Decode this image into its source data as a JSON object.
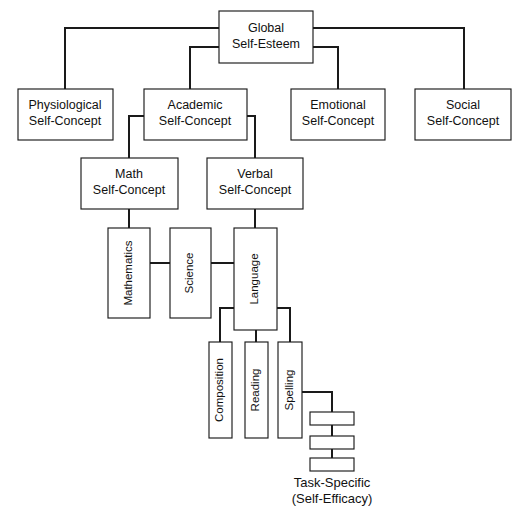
{
  "diagram": {
    "orientation": "top-down hierarchy",
    "colors": {
      "background": "#ffffff",
      "box_fill": "#ffffff",
      "stroke": "#1a1a1a",
      "text": "#111111"
    },
    "levels": {
      "level1": {
        "nodes": [
          {
            "id": "global",
            "line1": "Global",
            "line2": "Self-Esteem"
          }
        ]
      },
      "level2": {
        "nodes": [
          {
            "id": "physiological",
            "line1": "Physiological",
            "line2": "Self-Concept"
          },
          {
            "id": "academic",
            "line1": "Academic",
            "line2": "Self-Concept"
          },
          {
            "id": "emotional",
            "line1": "Emotional",
            "line2": "Self-Concept"
          },
          {
            "id": "social",
            "line1": "Social",
            "line2": "Self-Concept"
          }
        ]
      },
      "level3": {
        "nodes": [
          {
            "id": "math",
            "line1": "Math",
            "line2": "Self-Concept"
          },
          {
            "id": "verbal",
            "line1": "Verbal",
            "line2": "Self-Concept"
          }
        ]
      },
      "level4": {
        "nodes": [
          {
            "id": "mathematics",
            "label": "Mathematics"
          },
          {
            "id": "science",
            "label": "Science"
          },
          {
            "id": "language",
            "label": "Language"
          }
        ]
      },
      "level5": {
        "nodes": [
          {
            "id": "composition",
            "label": "Composition"
          },
          {
            "id": "reading",
            "label": "Reading"
          },
          {
            "id": "spelling",
            "label": "Spelling"
          }
        ]
      },
      "level6": {
        "nodes": [
          {
            "id": "task1",
            "label": ""
          },
          {
            "id": "task2",
            "label": ""
          },
          {
            "id": "task3",
            "label": ""
          }
        ],
        "caption_line1": "Task-Specific",
        "caption_line2": "(Self-Efficacy)"
      }
    }
  }
}
